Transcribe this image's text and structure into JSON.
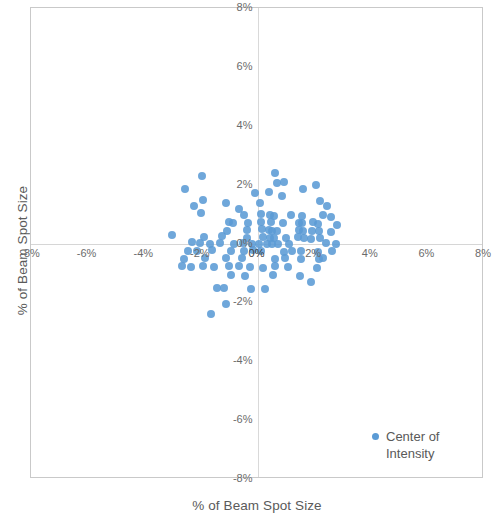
{
  "chart_data": {
    "type": "scatter",
    "title": "",
    "xlabel": "% of Beam Spot Size",
    "ylabel": "% of Beam Spot Size",
    "xlim": [
      -8,
      8
    ],
    "ylim": [
      -8,
      8
    ],
    "grid": false,
    "axis_lines_through_origin": true,
    "x_ticks": [
      "-8%",
      "-6%",
      "-4%",
      "-2%",
      "0%",
      "2%",
      "4%",
      "6%",
      "8%"
    ],
    "x_tick_values": [
      -8,
      -6,
      -4,
      -2,
      0,
      2,
      4,
      6,
      8
    ],
    "y_ticks": [
      "8%",
      "6%",
      "4%",
      "2%",
      "0%",
      "-2%",
      "-4%",
      "-6%",
      "-8%"
    ],
    "y_tick_values": [
      8,
      6,
      4,
      2,
      0,
      -2,
      -4,
      -6,
      -8
    ],
    "legend": {
      "position": "bottom-right",
      "entries": [
        {
          "name": "Center of Intensity",
          "line1": "Center of",
          "line2": "Intensity",
          "color": "#5b9bd5",
          "marker": "circle"
        }
      ]
    },
    "series": [
      {
        "name": "Center of Intensity",
        "color": "#5b9bd5",
        "marker": "circle",
        "points": [
          [
            -2.55,
            1.85
          ],
          [
            -1.95,
            2.3
          ],
          [
            -0.1,
            1.72
          ],
          [
            0.62,
            2.38
          ],
          [
            0.7,
            2.06
          ],
          [
            0.92,
            2.1
          ],
          [
            0.4,
            1.76
          ],
          [
            1.62,
            1.84
          ],
          [
            2.06,
            2.0
          ],
          [
            -2.25,
            1.28
          ],
          [
            -1.92,
            1.48
          ],
          [
            -1.1,
            1.38
          ],
          [
            0.08,
            1.36
          ],
          [
            2.2,
            1.44
          ],
          [
            -0.46,
            0.96
          ],
          [
            0.12,
            1.0
          ],
          [
            0.44,
            0.98
          ],
          [
            0.6,
            0.92
          ],
          [
            1.2,
            0.98
          ],
          [
            1.56,
            0.94
          ],
          [
            2.3,
            0.96
          ],
          [
            2.58,
            0.9
          ],
          [
            -1.0,
            0.72
          ],
          [
            -0.86,
            0.7
          ],
          [
            -0.34,
            0.68
          ],
          [
            0.14,
            0.72
          ],
          [
            0.46,
            0.74
          ],
          [
            0.9,
            0.7
          ],
          [
            1.46,
            0.7
          ],
          [
            1.58,
            0.68
          ],
          [
            1.96,
            0.72
          ],
          [
            2.12,
            0.66
          ],
          [
            2.8,
            0.64
          ],
          [
            -1.06,
            0.44
          ],
          [
            -0.36,
            0.46
          ],
          [
            0.16,
            0.48
          ],
          [
            0.42,
            0.46
          ],
          [
            0.52,
            0.44
          ],
          [
            0.7,
            0.42
          ],
          [
            1.46,
            0.46
          ],
          [
            1.62,
            0.44
          ],
          [
            1.94,
            0.44
          ],
          [
            2.16,
            0.42
          ],
          [
            2.6,
            0.4
          ],
          [
            -3.02,
            0.3
          ],
          [
            -1.88,
            0.22
          ],
          [
            -1.24,
            0.24
          ],
          [
            -0.38,
            0.2
          ],
          [
            0.18,
            0.22
          ],
          [
            0.44,
            0.2
          ],
          [
            0.58,
            0.18
          ],
          [
            1.0,
            0.2
          ],
          [
            1.44,
            0.22
          ],
          [
            1.66,
            0.18
          ],
          [
            1.9,
            0.16
          ],
          [
            2.2,
            0.18
          ],
          [
            -2.3,
            0.04
          ],
          [
            -2.04,
            0.02
          ],
          [
            -1.68,
            0.0
          ],
          [
            -1.34,
            0.02
          ],
          [
            -0.82,
            0.0
          ],
          [
            -0.52,
            0.02
          ],
          [
            -0.2,
            0.0
          ],
          [
            0.06,
            -0.02
          ],
          [
            0.34,
            0.0
          ],
          [
            0.52,
            -0.02
          ],
          [
            0.72,
            0.0
          ],
          [
            2.42,
            0.02
          ],
          [
            2.78,
            0.0
          ],
          [
            -2.44,
            -0.26
          ],
          [
            -2.12,
            -0.24
          ],
          [
            -1.6,
            -0.22
          ],
          [
            -0.92,
            -0.24
          ],
          [
            -0.48,
            -0.26
          ],
          [
            -0.16,
            -0.22
          ],
          [
            0.14,
            -0.24
          ],
          [
            0.92,
            -0.28
          ],
          [
            1.22,
            -0.26
          ],
          [
            1.52,
            -0.24
          ],
          [
            2.14,
            -0.28
          ],
          [
            2.62,
            -0.26
          ],
          [
            -2.58,
            -0.52
          ],
          [
            -1.86,
            -0.5
          ],
          [
            -1.1,
            -0.48
          ],
          [
            -0.56,
            -0.5
          ],
          [
            0.62,
            -0.52
          ],
          [
            0.96,
            -0.48
          ],
          [
            1.54,
            -0.54
          ],
          [
            2.16,
            -0.52
          ],
          [
            2.3,
            -0.5
          ],
          [
            -2.66,
            -0.78
          ],
          [
            -2.34,
            -0.8
          ],
          [
            -1.92,
            -0.76
          ],
          [
            -1.54,
            -0.8
          ],
          [
            -1.0,
            -0.76
          ],
          [
            -0.64,
            -0.78
          ],
          [
            -0.26,
            -0.8
          ],
          [
            0.18,
            -0.82
          ],
          [
            0.62,
            -0.78
          ],
          [
            1.06,
            -0.8
          ],
          [
            2.1,
            -0.82
          ],
          [
            -0.94,
            -1.06
          ],
          [
            -0.44,
            -1.1
          ],
          [
            0.54,
            -1.08
          ],
          [
            1.5,
            -1.12
          ],
          [
            1.9,
            -1.3
          ],
          [
            -1.42,
            -1.52
          ],
          [
            -1.18,
            -1.5
          ],
          [
            -0.22,
            -1.54
          ],
          [
            0.28,
            -1.56
          ],
          [
            -1.1,
            -2.06
          ],
          [
            -1.66,
            -2.4
          ],
          [
            -2.0,
            1.04
          ],
          [
            0.86,
            1.6
          ],
          [
            2.46,
            1.28
          ],
          [
            -0.66,
            1.16
          ],
          [
            1.1,
            -0.02
          ]
        ]
      }
    ]
  }
}
